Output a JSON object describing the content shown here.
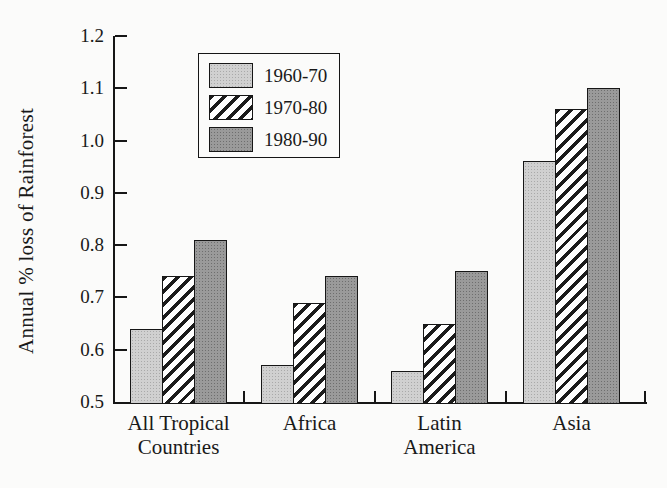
{
  "chart_data": {
    "type": "bar",
    "title": "",
    "xlabel": "",
    "ylabel": "Annual % loss of Rainforest",
    "categories": [
      "All Tropical Countries",
      "Africa",
      "Latin America",
      "Asia"
    ],
    "categories_multiline": [
      [
        "All Tropical",
        "Countries"
      ],
      [
        "Africa"
      ],
      [
        "Latin",
        "America"
      ],
      [
        "Asia"
      ]
    ],
    "series": [
      {
        "name": "1960-70",
        "pattern": "light-halftone",
        "fill_color": "#d0d0d0",
        "dot_color": "#a9a9a9",
        "values": [
          0.64,
          0.57,
          0.56,
          0.96
        ]
      },
      {
        "name": "1970-80",
        "pattern": "diagonal-hatch",
        "fill_color": "#ffffff",
        "stripe_color": "#1c1c1c",
        "values": [
          0.74,
          0.69,
          0.65,
          1.06
        ]
      },
      {
        "name": "1980-90",
        "pattern": "dark-halftone",
        "fill_color": "#9a9a9a",
        "dot_color": "#6e6e6e",
        "values": [
          0.81,
          0.74,
          0.75,
          1.1
        ]
      }
    ],
    "ylim": [
      0.5,
      1.2
    ],
    "ytick_step": 0.1,
    "yticks": [
      "0.5",
      "0.6",
      "0.7",
      "0.8",
      "0.9",
      "1.0",
      "1.1",
      "1.2"
    ],
    "legend_position": "upper-left-inside",
    "grid": false,
    "axis_color": "#161616",
    "background_color": "#fbfbfa"
  }
}
